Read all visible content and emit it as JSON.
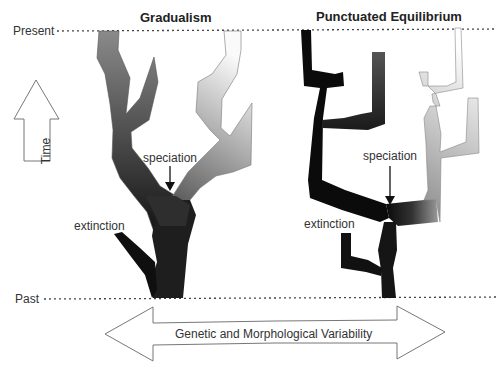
{
  "titles": {
    "left": "Gradualism",
    "right": "Punctuated Equilibrium"
  },
  "time_axis": {
    "present_label": "Present",
    "past_label": "Past",
    "arrow_label": "Time"
  },
  "variability_axis": {
    "label": "Genetic and Morphological Variability"
  },
  "annotations": {
    "gradualism": {
      "speciation": "speciation",
      "extinction": "extinction"
    },
    "punctuated": {
      "speciation": "speciation",
      "extinction": "extinction"
    }
  },
  "colors": {
    "dark": "#111111",
    "mid": "#666666",
    "light": "#f4f4f4",
    "outline": "#777777",
    "dotted_line": "#444444"
  }
}
